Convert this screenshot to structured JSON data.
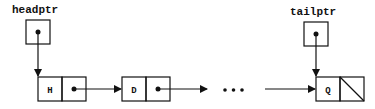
{
  "diagram": {
    "type": "singly-linked-list",
    "pointers": [
      {
        "label": "headptr",
        "points_to": "H"
      },
      {
        "label": "tailptr",
        "points_to": "Q"
      }
    ],
    "nodes": [
      {
        "value": "H",
        "next": "pointer"
      },
      {
        "value": "D",
        "next": "pointer"
      },
      {
        "value": "Q",
        "next": "null"
      }
    ],
    "ellipsis": "..."
  },
  "colors": {
    "stroke": "#111111",
    "background": "#ffffff"
  }
}
